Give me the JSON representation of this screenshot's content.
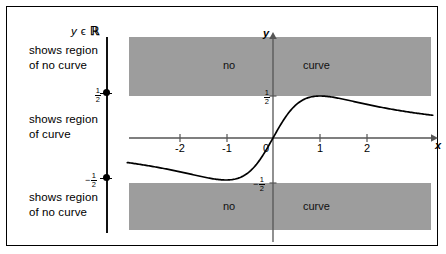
{
  "diagram": {
    "title_note": "y ϵ ℝ",
    "annotations": [
      {
        "id": "top",
        "text": "shows region\nof no curve"
      },
      {
        "id": "middle",
        "text": "shows region\nof curve"
      },
      {
        "id": "bottom",
        "text": "shows region\nof no curve"
      }
    ],
    "number_line": {
      "upper_bound_label": "1/2",
      "lower_bound_label": "-1/2",
      "upper_numerator": "1",
      "upper_denominator": "2",
      "lower_numerator": "1",
      "lower_denominator": "2",
      "lower_sign": "−",
      "endpoints_closed": "true"
    },
    "shaded_regions": [
      {
        "id": "top",
        "word_left": "no",
        "word_right": "curve",
        "color": "#9d9d9d"
      },
      {
        "id": "bottom",
        "word_left": "no",
        "word_right": "curve",
        "color": "#9d9d9d"
      }
    ],
    "axes": {
      "x_label": "x",
      "y_label": "y",
      "x_ticks": [
        "-2",
        "-1",
        "0",
        "1",
        "2"
      ],
      "y_ticks": [
        "1/2",
        "-1/2"
      ],
      "y_tick_upper_num": "1",
      "y_tick_upper_den": "2",
      "y_tick_lower_num": "1",
      "y_tick_lower_den": "2",
      "y_tick_lower_sign": "−"
    },
    "colors": {
      "shade": "#9d9d9d",
      "curve": "#000000",
      "axis": "#555555",
      "border": "#000000"
    }
  },
  "chart_data": {
    "type": "line",
    "title": "",
    "xlabel": "x",
    "ylabel": "y",
    "xlim": [
      -3.1,
      3.4
    ],
    "ylim": [
      -0.95,
      1.05
    ],
    "xticks": [
      -2,
      -1,
      0,
      1,
      2
    ],
    "yticks": [
      -0.5,
      0.5
    ],
    "grid": false,
    "legend": false,
    "function": "y = x / (x^2 + 1)",
    "series": [
      {
        "name": "y = x/(x^2+1)",
        "x": [
          -3.1,
          -2.8,
          -2.5,
          -2.2,
          -2.0,
          -1.8,
          -1.5,
          -1.2,
          -1.0,
          -0.8,
          -0.6,
          -0.4,
          -0.2,
          0.0,
          0.2,
          0.4,
          0.6,
          0.8,
          1.0,
          1.2,
          1.5,
          1.8,
          2.0,
          2.2,
          2.5,
          2.8,
          3.1,
          3.4
        ],
        "y": [
          -0.29,
          -0.317,
          -0.345,
          -0.369,
          -0.4,
          -0.419,
          -0.462,
          -0.492,
          -0.5,
          -0.488,
          -0.441,
          -0.345,
          -0.192,
          0.0,
          0.192,
          0.345,
          0.441,
          0.488,
          0.5,
          0.492,
          0.462,
          0.419,
          0.4,
          0.369,
          0.345,
          0.317,
          0.29,
          0.268
        ]
      }
    ],
    "annotations": [
      {
        "text": "no",
        "region": "top-left"
      },
      {
        "text": "curve",
        "region": "top-right"
      },
      {
        "text": "no",
        "region": "bottom-left"
      },
      {
        "text": "curve",
        "region": "bottom-right"
      }
    ],
    "shaded_y_ranges": [
      [
        0.5,
        1.05
      ],
      [
        -0.95,
        -0.5
      ]
    ]
  }
}
